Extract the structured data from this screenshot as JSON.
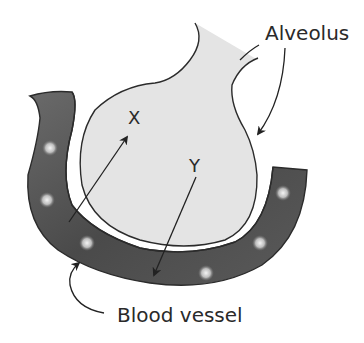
{
  "diagram": {
    "labels": {
      "alveolus": "Alveolus",
      "blood_vessel": "Blood vessel",
      "x": "X",
      "y": "Y"
    },
    "colors": {
      "alveolus_fill": "#e4e4e4",
      "outline": "#2b2b2b",
      "vessel_dark": "#3c3c3c",
      "vessel_light": "#8a8a8a",
      "cell_highlight": "#f2f2f2",
      "background": "#ffffff"
    },
    "arrows": [
      {
        "name": "arrow-x",
        "from": "blood vessel",
        "to": "X",
        "direction": "vessel to alveolus"
      },
      {
        "name": "arrow-y",
        "from": "Y",
        "to": "blood vessel",
        "direction": "alveolus to vessel"
      }
    ]
  }
}
